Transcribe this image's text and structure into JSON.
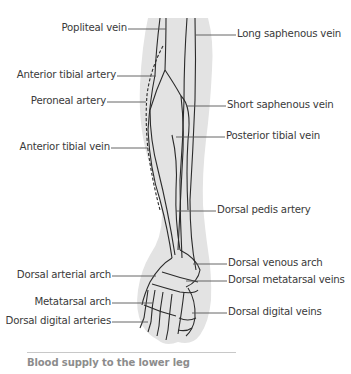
{
  "figure": {
    "title": "Blood supply to the lower leg",
    "colors": {
      "skin_fill": "#e3e3e3",
      "vessel_stroke": "#2b2b2b",
      "leader_line": "#555555",
      "label_text": "#3a3a3a",
      "caption_text": "#8c8c8c",
      "caption_rule": "#c8c8c8"
    },
    "labels_left": [
      {
        "id": "popliteal-vein",
        "text": "Popliteal vein"
      },
      {
        "id": "anterior-tibial-artery",
        "text": "Anterior tibial artery"
      },
      {
        "id": "peroneal-artery",
        "text": "Peroneal artery"
      },
      {
        "id": "anterior-tibial-vein",
        "text": "Anterior tibial vein"
      },
      {
        "id": "dorsal-arterial-arch",
        "text": "Dorsal arterial arch"
      },
      {
        "id": "metatarsal-arch",
        "text": "Metatarsal arch"
      },
      {
        "id": "dorsal-digital-arteries",
        "text": "Dorsal digital arteries"
      }
    ],
    "labels_right": [
      {
        "id": "long-saphenous-vein",
        "text": "Long saphenous vein"
      },
      {
        "id": "short-saphenous-vein",
        "text": "Short saphenous vein"
      },
      {
        "id": "posterior-tibial-vein",
        "text": "Posterior tibial vein"
      },
      {
        "id": "dorsal-pedis-artery",
        "text": "Dorsal pedis artery"
      },
      {
        "id": "dorsal-venous-arch",
        "text": "Dorsal venous arch"
      },
      {
        "id": "dorsal-metatarsal-veins",
        "text": "Dorsal metatarsal veins"
      },
      {
        "id": "dorsal-digital-veins",
        "text": "Dorsal digital veins"
      }
    ]
  }
}
